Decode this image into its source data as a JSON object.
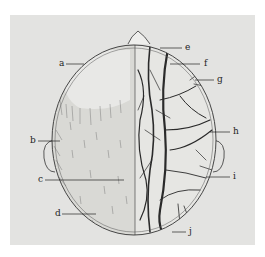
{
  "figure": {
    "colors": {
      "panel": "#e3e3e1",
      "ink": "#2a2a2a"
    },
    "labels": [
      {
        "id": "a",
        "text": "a"
      },
      {
        "id": "b",
        "text": "b"
      },
      {
        "id": "c",
        "text": "c"
      },
      {
        "id": "d",
        "text": "d"
      },
      {
        "id": "e",
        "text": "e"
      },
      {
        "id": "f",
        "text": "f"
      },
      {
        "id": "g",
        "text": "g"
      },
      {
        "id": "h",
        "text": "h"
      },
      {
        "id": "i",
        "text": "i"
      },
      {
        "id": "j",
        "text": "j"
      }
    ]
  }
}
